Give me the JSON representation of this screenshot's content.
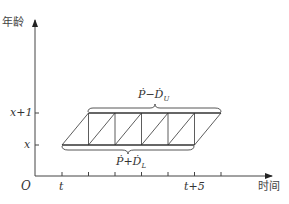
{
  "diagram": {
    "y_axis_label": "年龄",
    "x_axis_label": "时间",
    "origin_label": "O",
    "y_ticks": [
      {
        "label": "x+1",
        "level": "upper"
      },
      {
        "label": "x",
        "level": "lower"
      }
    ],
    "x_ticks": [
      {
        "label": "t",
        "index": 0
      },
      {
        "label": "t+5",
        "index": 5
      }
    ],
    "x_tick_count": 6,
    "upper_brace_label": {
      "base": "Ṗ−Ḋ",
      "sub": "U"
    },
    "lower_brace_label": {
      "base": "Ṗ+Ḋ",
      "sub": "L"
    },
    "line_color": "#333333"
  }
}
